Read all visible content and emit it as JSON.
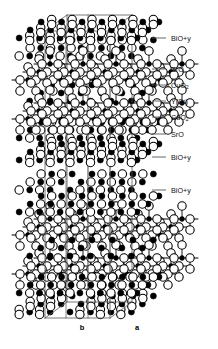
{
  "figure": {
    "kind": "crystal-structure-diagram",
    "background": "#ffffff",
    "line_color": "#555555",
    "bond_color": "#000000",
    "atom_fill_dark": "#000000",
    "atom_fill_light": "#ffffff",
    "atom_stroke": "#000000"
  },
  "axes": {
    "b_label": "b",
    "a_label": "a",
    "b_x": 82,
    "a_x": 137,
    "y": 330
  },
  "legend": {
    "tick_x1": 152,
    "tick_x2": 166,
    "label_x": 171,
    "items": [
      {
        "label": "BiO+y",
        "sub": "",
        "y": 38
      },
      {
        "label": "SrO",
        "sub": "",
        "y": 69
      },
      {
        "label": "CuO",
        "sub": "2",
        "y": 85
      },
      {
        "label": "Y(Sr)",
        "sub": "",
        "y": 101
      },
      {
        "label": "CuO",
        "sub": "2",
        "y": 117
      },
      {
        "label": "SrO",
        "sub": "",
        "y": 134
      },
      {
        "label": "BiO+y",
        "sub": "",
        "y": 157
      },
      {
        "label": "BiO+y",
        "sub": "",
        "y": 190
      }
    ]
  },
  "chart_data": {
    "type": "scatter",
    "title": "",
    "xlabel": "b",
    "ylabel": "a",
    "cell": {
      "front_bottom_left": [
        45,
        318
      ],
      "front_bottom_right": [
        110,
        318
      ],
      "front_top_left": [
        45,
        31
      ],
      "front_top_right": [
        110,
        31
      ],
      "depth_dx": 22,
      "depth_dy": -16,
      "inner_x": [
        66,
        88
      ]
    },
    "dark_radius": 3.0,
    "light_radius": 4.2,
    "small_dark_radius": 2.4,
    "layers": [
      {
        "name": "BiO+y",
        "y": 38,
        "dark_xs": [
          18,
          51,
          84,
          116,
          149,
          182,
          208
        ],
        "light_pairs": [
          35,
          68,
          100,
          133,
          166,
          199
        ],
        "pair_dy": 5
      },
      {
        "name": "SrO",
        "y": 56,
        "dark_xs": [
          35,
          68,
          100,
          133,
          166,
          199
        ],
        "light_xs": [
          18,
          51,
          84,
          116,
          149,
          182
        ],
        "apical": true
      },
      {
        "name": "CuO2-a",
        "y": 80,
        "plane": true
      },
      {
        "name": "Y(Sr)",
        "y": 101,
        "dark_xs": [
          35,
          68,
          100,
          133,
          166,
          199
        ]
      },
      {
        "name": "CuO2-b",
        "y": 119,
        "plane": true
      },
      {
        "name": "SrO",
        "y": 138,
        "dark_xs": [
          18,
          51,
          84,
          116,
          149,
          182,
          208
        ],
        "light_xs": [
          35,
          68,
          100,
          133,
          166,
          199
        ]
      },
      {
        "name": "BiO+y",
        "y": 160,
        "dark_xs": [
          18,
          51,
          84,
          116,
          149,
          182,
          208
        ],
        "light_pairs": [
          35,
          68,
          100,
          133,
          166,
          199
        ],
        "pair_dy": 5
      },
      {
        "name": "BiO+y",
        "y": 190,
        "dark_xs": [
          35,
          68,
          100,
          133,
          166,
          199
        ],
        "light_xs": [
          18,
          51,
          116,
          149,
          182
        ]
      },
      {
        "name": "SrO",
        "y": 212,
        "dark_xs": [
          18,
          51,
          84,
          116,
          149,
          182,
          208
        ],
        "light_xs": [
          35,
          68,
          100,
          133,
          166,
          199
        ],
        "apical": true
      },
      {
        "name": "CuO2-c",
        "y": 235,
        "plane": true
      },
      {
        "name": "Y(Sr)",
        "y": 256,
        "dark_xs": [
          35,
          68,
          100,
          133,
          166,
          199
        ]
      },
      {
        "name": "CuO2-d",
        "y": 274,
        "plane": true
      },
      {
        "name": "SrO",
        "y": 293,
        "dark_xs": [
          18,
          51,
          84,
          116,
          149,
          182,
          208
        ],
        "light_xs": [
          35,
          68,
          100,
          133,
          166,
          199
        ]
      },
      {
        "name": "BiO+y",
        "y": 312,
        "dark_xs": [
          35,
          68,
          100,
          133,
          166,
          199
        ],
        "light_pairs": [
          18,
          51,
          116,
          149,
          182
        ],
        "pair_dy": 5
      }
    ],
    "plane_rows": [
      {
        "offset_x": 0,
        "offset_y": 0
      },
      {
        "offset_x": 11,
        "offset_y": -8
      },
      {
        "offset_x": 22,
        "offset_y": -16
      }
    ],
    "plane_cu_xs": [
      28,
      61,
      94,
      127,
      160
    ],
    "plane_o_gap": 16
  }
}
